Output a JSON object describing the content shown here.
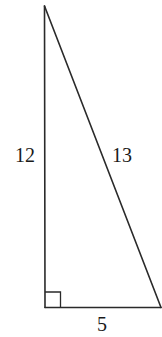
{
  "diagram": {
    "type": "right-triangle",
    "vertices": {
      "top": {
        "x": 44.5,
        "y": 6
      },
      "right_angle": {
        "x": 45,
        "y": 307.5
      },
      "bottom_right": {
        "x": 161,
        "y": 307.5
      }
    },
    "right_angle_marker": {
      "x": 45,
      "y": 292,
      "size": 15.5
    },
    "sides": {
      "vertical": {
        "label": "12",
        "x": 25,
        "y": 162
      },
      "hypotenuse": {
        "label": "13",
        "x": 122,
        "y": 162
      },
      "base": {
        "label": "5",
        "x": 102,
        "y": 331
      }
    },
    "colors": {
      "stroke": "#2a2a2a",
      "text": "#1a1a1a",
      "background": "#ffffff"
    }
  }
}
